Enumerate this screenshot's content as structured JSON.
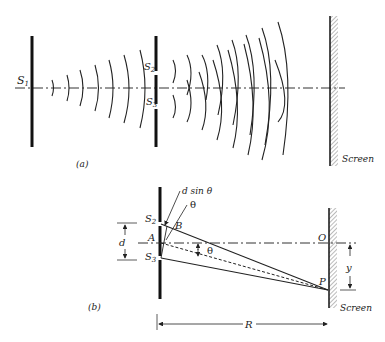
{
  "figure_a": {
    "caption": "(a)",
    "source_label": "S",
    "source_sub": "1",
    "slit_top_label": "S",
    "slit_top_sub": "2",
    "slit_bottom_label": "S",
    "slit_bottom_sub": "3",
    "screen_label": "Screen"
  },
  "figure_b": {
    "caption": "(b)",
    "path_diff_label": "d sin θ",
    "theta_label_top": "θ",
    "theta_label_mid": "θ",
    "s2_label": "S",
    "s2_sub": "2",
    "s3_label": "S",
    "s3_sub": "3",
    "a_label": "A",
    "b_label": "B",
    "d_label": "d",
    "o_label": "O",
    "p_label": "P",
    "y_label": "y",
    "r_label": "R",
    "screen_label": "Screen"
  }
}
